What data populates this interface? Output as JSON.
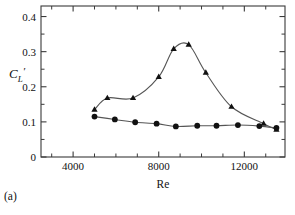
{
  "figure": {
    "panel_label": "(a)",
    "background_color": "#ffffff",
    "foreground_color": "#111111"
  },
  "chart_data": {
    "type": "line",
    "title": "",
    "subtitle": "",
    "xlabel": "Re",
    "ylabel": "C'_L",
    "ylabel_parts": {
      "base": "C",
      "subscript": "L",
      "prime": "′"
    },
    "xlim": [
      2500,
      13900
    ],
    "ylim": [
      0,
      0.43
    ],
    "x_ticks_major": [
      4000,
      8000,
      12000
    ],
    "x_tick_labels": [
      "4000",
      "8000",
      "12000"
    ],
    "x_ticks_minor": [
      3000,
      5000,
      6000,
      7000,
      9000,
      10000,
      11000,
      13000
    ],
    "y_ticks_major": [
      0,
      0.1,
      0.2,
      0.3,
      0.4
    ],
    "y_tick_labels": [
      "0",
      "0.1",
      "0.2",
      "0.3",
      "0.4"
    ],
    "y_ticks_minor": [
      0.05,
      0.15,
      0.25,
      0.35
    ],
    "grid": false,
    "legend": false,
    "legend_position": "none",
    "series": [
      {
        "name": "triangle-series",
        "marker": "triangle",
        "marker_color": "#111111",
        "line_color": "#555555",
        "x": [
          5000,
          5600,
          6800,
          8000,
          8700,
          9400,
          10200,
          11400,
          12900,
          13500
        ],
        "y": [
          0.135,
          0.168,
          0.168,
          0.228,
          0.308,
          0.32,
          0.24,
          0.143,
          0.095,
          0.078
        ]
      },
      {
        "name": "circle-series",
        "marker": "circle",
        "marker_color": "#111111",
        "line_color": "#555555",
        "x": [
          5000,
          5950,
          6900,
          7900,
          8800,
          9800,
          10700,
          11700,
          12700,
          13500
        ],
        "y": [
          0.115,
          0.107,
          0.099,
          0.095,
          0.087,
          0.089,
          0.089,
          0.091,
          0.088,
          0.083
        ]
      }
    ]
  }
}
